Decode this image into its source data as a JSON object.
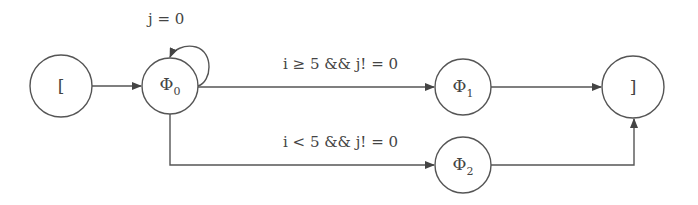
{
  "diagram": {
    "type": "state-machine",
    "nodes": [
      {
        "id": "start",
        "label": "[",
        "sub": ""
      },
      {
        "id": "phi0",
        "label": "Φ",
        "sub": "0"
      },
      {
        "id": "phi1",
        "label": "Φ",
        "sub": "1"
      },
      {
        "id": "phi2",
        "label": "Φ",
        "sub": "2"
      },
      {
        "id": "end",
        "label": "]",
        "sub": ""
      }
    ],
    "edges": [
      {
        "from": "start",
        "to": "phi0",
        "label": ""
      },
      {
        "from": "phi0",
        "to": "phi0",
        "label": "j = 0"
      },
      {
        "from": "phi0",
        "to": "phi1",
        "label": "i ≥ 5 && j! = 0"
      },
      {
        "from": "phi0",
        "to": "phi2",
        "label": "i < 5 && j! = 0"
      },
      {
        "from": "phi1",
        "to": "end",
        "label": ""
      },
      {
        "from": "phi2",
        "to": "end",
        "label": ""
      }
    ]
  }
}
